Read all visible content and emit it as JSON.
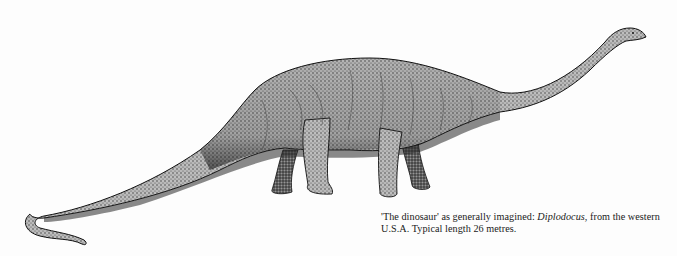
{
  "figure": {
    "caption": {
      "part1": "'The dinosaur' as generally imagined: ",
      "italic": "Diplodocus",
      "part2": ", from the western U.S.A. Typical length 26 metres."
    }
  },
  "colors": {
    "background": "#fdfdfd",
    "ink": "#1a1a1a",
    "mid_gray": "#8a8a8a",
    "light_gray": "#c8c8c8"
  }
}
